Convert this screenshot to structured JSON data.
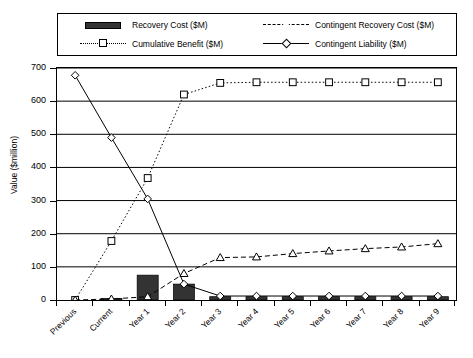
{
  "chart_data": {
    "type": "bar",
    "title": "",
    "subtitle": "",
    "xlabel": "",
    "ylabel": "Value ($million)",
    "ylim": [
      0,
      700
    ],
    "ytick_step": 100,
    "yticks": [
      0,
      100,
      200,
      300,
      400,
      500,
      600,
      700
    ],
    "grid": true,
    "grid_axis": "y",
    "legend_position": "top",
    "categories": [
      "Previous",
      "Current",
      "Year 1",
      "Year 2",
      "Year 3",
      "Year 4",
      "Year 5",
      "Year 6",
      "Year 7",
      "Year 8",
      "Year 9"
    ],
    "series": [
      {
        "name": "Recovery Cost ($M)",
        "type": "bar",
        "marker": "none",
        "line_style": "none",
        "fill": "#333333",
        "values": [
          0,
          5,
          75,
          48,
          10,
          10,
          10,
          10,
          10,
          10,
          10
        ]
      },
      {
        "name": "Cumulative Benefit ($M)",
        "type": "line",
        "marker": "square",
        "line_style": "dotted",
        "fill": "#000000",
        "values": [
          0,
          178,
          368,
          620,
          655,
          657,
          657,
          657,
          657,
          657,
          657
        ]
      },
      {
        "name": "Contingent Recovery Cost ($M)",
        "type": "line",
        "marker": "triangle",
        "line_style": "dashed",
        "fill": "#000000",
        "values": [
          0,
          3,
          10,
          80,
          128,
          130,
          140,
          148,
          155,
          160,
          170
        ]
      },
      {
        "name": "Contingent Liability ($M)",
        "type": "line",
        "marker": "diamond",
        "line_style": "solid",
        "fill": "#000000",
        "values": [
          678,
          490,
          305,
          48,
          12,
          12,
          12,
          12,
          12,
          12,
          12
        ]
      }
    ]
  },
  "legend": {
    "entries": [
      {
        "label": "Recovery Cost ($M)",
        "key": "filled-bar-swatch"
      },
      {
        "label": "Cumulative Benefit ($M)",
        "key": "dotted-line-square-marker"
      },
      {
        "label": "Contingent Recovery Cost ($M)",
        "key": "dashed-line-triangle-marker"
      },
      {
        "label": "Contingent Liability ($M)",
        "key": "solid-line-diamond-marker"
      }
    ]
  },
  "colors": {
    "bar_fill": "#333333",
    "axis": "#000000",
    "grid": "#000000",
    "background": "#ffffff"
  }
}
